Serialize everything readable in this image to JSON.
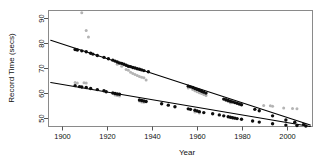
{
  "chart_data": {
    "type": "scatter",
    "title": "",
    "xlabel": "Year",
    "ylabel": "Record Time (secs)",
    "xlim": [
      1893,
      2012
    ],
    "ylim": [
      46,
      96
    ],
    "grid": false,
    "legend": null,
    "xticks": [
      1900,
      1920,
      1940,
      1960,
      1980,
      2000
    ],
    "xticklabels": [
      "1900",
      "1920",
      "1940",
      "1960",
      "1980",
      "2000"
    ],
    "yticks": [
      50,
      60,
      70,
      80,
      90
    ],
    "yticklabels": [
      "50",
      "60",
      "70",
      "80",
      "90"
    ],
    "colors": {
      "series_upper_points": "#0d0d0d",
      "series_lower_points": "#0d0d0d",
      "secondary_points": "#b4b4b4",
      "fit_line": "#000000",
      "frame": "#8a8a8a",
      "background": "#ffffff"
    },
    "series": [
      {
        "name": "upper-record-series",
        "marker": "filled-circle",
        "color": "#0d0d0d",
        "points": [
          [
            1905,
            79.2
          ],
          [
            1906,
            79.0
          ],
          [
            1908,
            78.6
          ],
          [
            1910,
            78.2
          ],
          [
            1912,
            77.6
          ],
          [
            1913,
            77.2
          ],
          [
            1915,
            76.6
          ],
          [
            1918,
            75.8
          ],
          [
            1920,
            75.2
          ],
          [
            1922,
            74.6
          ],
          [
            1923,
            74.2
          ],
          [
            1924,
            73.8
          ],
          [
            1925,
            73.4
          ],
          [
            1926,
            73.2
          ],
          [
            1927,
            72.8
          ],
          [
            1928,
            72.4
          ],
          [
            1929,
            72.0
          ],
          [
            1930,
            71.8
          ],
          [
            1931,
            71.4
          ],
          [
            1932,
            71.2
          ],
          [
            1933,
            70.9
          ],
          [
            1934,
            70.7
          ],
          [
            1935,
            70.4
          ],
          [
            1936,
            70.1
          ],
          [
            1938,
            69.6
          ],
          [
            1956,
            63.4
          ],
          [
            1957,
            63.1
          ],
          [
            1958,
            62.8
          ],
          [
            1959,
            62.4
          ],
          [
            1960,
            62.0
          ],
          [
            1961,
            61.6
          ],
          [
            1962,
            61.2
          ],
          [
            1963,
            60.8
          ],
          [
            1964,
            60.4
          ],
          [
            1972,
            57.8
          ],
          [
            1973,
            57.5
          ],
          [
            1974,
            57.2
          ],
          [
            1975,
            56.9
          ],
          [
            1976,
            56.6
          ],
          [
            1977,
            56.3
          ],
          [
            1978,
            56.0
          ],
          [
            1979,
            55.7
          ],
          [
            1980,
            55.4
          ],
          [
            1986,
            53.4
          ],
          [
            1988,
            52.8
          ],
          [
            1994,
            50.6
          ],
          [
            2000,
            48.8
          ],
          [
            2004,
            47.8
          ],
          [
            2008,
            46.9
          ]
        ]
      },
      {
        "name": "lower-record-series",
        "marker": "filled-circle",
        "color": "#0d0d0d",
        "points": [
          [
            1905,
            63.6
          ],
          [
            1907,
            63.2
          ],
          [
            1908,
            63.0
          ],
          [
            1910,
            62.8
          ],
          [
            1912,
            62.4
          ],
          [
            1915,
            61.9
          ],
          [
            1918,
            61.4
          ],
          [
            1919,
            61.0
          ],
          [
            1922,
            60.4
          ],
          [
            1923,
            60.2
          ],
          [
            1924,
            60.0
          ],
          [
            1925,
            59.9
          ],
          [
            1934,
            57.4
          ],
          [
            1935,
            57.2
          ],
          [
            1936,
            57.0
          ],
          [
            1937,
            56.8
          ],
          [
            1944,
            55.8
          ],
          [
            1947,
            55.2
          ],
          [
            1950,
            54.5
          ],
          [
            1956,
            53.6
          ],
          [
            1957,
            53.4
          ],
          [
            1959,
            53.0
          ],
          [
            1960,
            52.7
          ],
          [
            1961,
            52.4
          ],
          [
            1963,
            52.0
          ],
          [
            1967,
            51.5
          ],
          [
            1970,
            51.0
          ],
          [
            1972,
            50.6
          ],
          [
            1974,
            50.2
          ],
          [
            1975,
            50.0
          ],
          [
            1976,
            49.8
          ],
          [
            1977,
            49.6
          ],
          [
            1978,
            49.4
          ],
          [
            1980,
            49.1
          ],
          [
            1985,
            48.4
          ],
          [
            1988,
            47.9
          ],
          [
            1994,
            47.2
          ],
          [
            2000,
            46.6
          ],
          [
            2005,
            46.4
          ],
          [
            2009,
            46.2
          ]
        ]
      },
      {
        "name": "secondary-scatter",
        "marker": "small-circle",
        "color": "#b4b4b4",
        "points": [
          [
            1908,
            95.0
          ],
          [
            1910,
            87.4
          ],
          [
            1911,
            84.6
          ],
          [
            1905,
            65.0
          ],
          [
            1906,
            64.8
          ],
          [
            1909,
            64.9
          ],
          [
            1910,
            64.8
          ],
          [
            1922,
            60.8
          ],
          [
            1923,
            59.6
          ],
          [
            1924,
            59.4
          ],
          [
            1925,
            59.2
          ],
          [
            1934,
            57.0
          ],
          [
            1935,
            56.6
          ],
          [
            1936,
            56.4
          ],
          [
            1924,
            72.8
          ],
          [
            1926,
            72.0
          ],
          [
            1928,
            70.6
          ],
          [
            1929,
            70.2
          ],
          [
            1930,
            69.4
          ],
          [
            1931,
            68.8
          ],
          [
            1932,
            68.4
          ],
          [
            1933,
            68.0
          ],
          [
            1934,
            67.6
          ],
          [
            1935,
            67.2
          ],
          [
            1936,
            67.0
          ],
          [
            1937,
            66.0
          ],
          [
            1956,
            62.6
          ],
          [
            1958,
            62.0
          ],
          [
            1959,
            61.4
          ],
          [
            1960,
            61.0
          ],
          [
            1961,
            60.6
          ],
          [
            1962,
            60.2
          ],
          [
            1963,
            59.8
          ],
          [
            1964,
            59.4
          ],
          [
            1973,
            57.2
          ],
          [
            1974,
            56.8
          ],
          [
            1975,
            56.2
          ],
          [
            1959,
            52.2
          ],
          [
            1961,
            51.8
          ],
          [
            1990,
            55.0
          ],
          [
            1993,
            54.9
          ],
          [
            1994,
            54.7
          ],
          [
            1999,
            54.0
          ],
          [
            2003,
            53.8
          ],
          [
            2005,
            53.7
          ]
        ]
      }
    ],
    "fit_lines": [
      {
        "name": "upper-fit-line",
        "from": [
          1894,
          83.2
        ],
        "to": [
          2011,
          46.6
        ],
        "slope_per_year": -0.313,
        "intercept_1894": 83.2
      },
      {
        "name": "lower-fit-line",
        "from": [
          1894,
          65.0
        ],
        "to": [
          2011,
          46.0
        ],
        "slope_per_year": -0.162,
        "intercept_1894": 65.0
      }
    ]
  }
}
